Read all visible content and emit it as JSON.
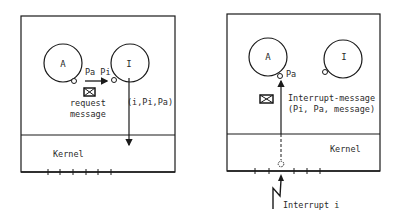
{
  "colors": {
    "ink": "#1a1a1a",
    "text": "#2a2a2a",
    "background": "#ffffff"
  },
  "left_panel": {
    "process_a": "A",
    "process_i": "I",
    "port_label": "Pa Pi",
    "message_label_line1": "request",
    "message_label_line2": "message",
    "call_label": "(i,Pi,Pa)",
    "kernel_label": "Kernel",
    "envelope_icon": "envelope-icon"
  },
  "right_panel": {
    "process_a": "A",
    "process_i": "I",
    "port_label": "Pa",
    "message_label_line1": "Interrupt-message",
    "message_label_line2": "(Pi, Pa, message)",
    "kernel_label": "Kernel",
    "interrupt_label": "Interrupt i",
    "envelope_icon": "envelope-icon"
  }
}
